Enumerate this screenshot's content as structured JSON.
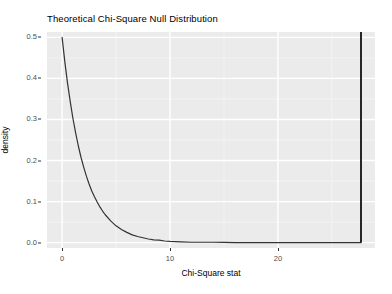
{
  "chart_data": {
    "type": "line",
    "title": "Theoretical Chi-Square Null Distribution",
    "xlabel": "Chi-Square stat",
    "ylabel": "density",
    "xlim": [
      -1.4,
      29.0
    ],
    "ylim": [
      -0.013,
      0.513
    ],
    "grid": true,
    "legend": null,
    "x_ticks": [
      0,
      10,
      20
    ],
    "x_tick_labels": [
      "0",
      "10",
      "20"
    ],
    "y_ticks": [
      0.0,
      0.1,
      0.2,
      0.3,
      0.4,
      0.5
    ],
    "y_tick_labels": [
      "0.0",
      "0.1",
      "0.2",
      "0.3",
      "0.4",
      "0.5"
    ],
    "x_minor_ticks": [
      -5,
      5,
      15,
      25
    ],
    "y_minor_ticks": [
      0.05,
      0.15,
      0.25,
      0.35,
      0.45
    ],
    "series": [
      {
        "name": "chi-square null density (df = 2)",
        "type": "line",
        "color": "#333333",
        "width": 1.2,
        "x": [
          0.0,
          0.25,
          0.5,
          0.75,
          1.0,
          1.25,
          1.5,
          1.75,
          2.0,
          2.25,
          2.5,
          2.75,
          3.0,
          3.25,
          3.5,
          3.75,
          4.0,
          4.5,
          5.0,
          5.5,
          6.0,
          6.5,
          7.0,
          7.5,
          8.0,
          8.5,
          9.0,
          9.5,
          10.0,
          11.0,
          12.0,
          13.0,
          14.0,
          15.0,
          16.0,
          17.0,
          18.0,
          19.0,
          20.0,
          21.0,
          22.0,
          23.0,
          24.0,
          25.0,
          26.0,
          27.0,
          27.7
        ],
        "y": [
          0.5,
          0.441,
          0.389,
          0.344,
          0.303,
          0.268,
          0.236,
          0.208,
          0.184,
          0.162,
          0.143,
          0.126,
          0.112,
          0.099,
          0.087,
          0.077,
          0.068,
          0.053,
          0.041,
          0.032,
          0.025,
          0.019,
          0.015,
          0.012,
          0.009,
          0.007,
          0.006,
          0.004,
          0.003,
          0.002,
          0.001,
          0.001,
          0.001,
          0.0006,
          0.0003,
          0.0002,
          0.0001,
          0.0001,
          5e-05,
          3e-05,
          2e-05,
          1e-05,
          6e-06,
          4e-06,
          2e-06,
          1e-06,
          1e-06
        ]
      },
      {
        "name": "observed chi-square statistic (vertical reference line)",
        "type": "vline",
        "color": "#262626",
        "width": 2.0,
        "x": 27.7
      }
    ]
  },
  "style": {
    "panel_fill": "#ebebeb",
    "major_grid_color": "#ffffff",
    "minor_grid_color": "#f5f5f5",
    "plot_background": "#ffffff",
    "axis_text_color": "#4d4d4d",
    "title_color": "#000000"
  }
}
